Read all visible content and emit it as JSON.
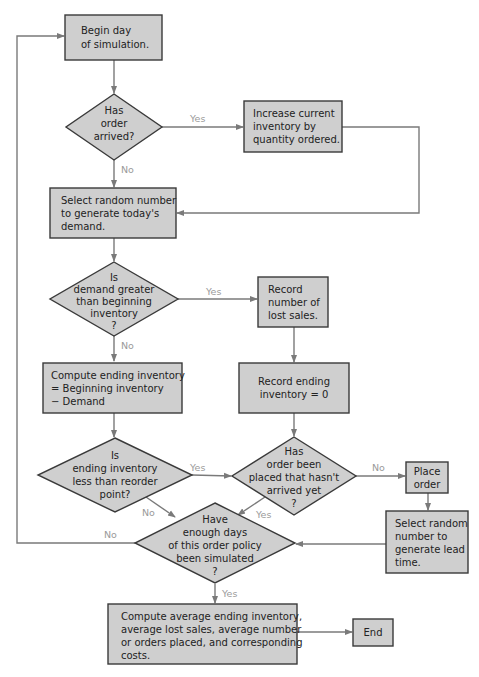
{
  "nodes": {
    "begin": {
      "type": "process",
      "lines": [
        "Begin day",
        "of simulation."
      ]
    },
    "order_arrived": {
      "type": "decision",
      "lines": [
        "Has",
        "order",
        "arrived?"
      ]
    },
    "increase_inventory": {
      "type": "process",
      "lines": [
        "Increase current",
        "inventory by",
        "quantity ordered."
      ]
    },
    "select_demand": {
      "type": "process",
      "lines": [
        "Select random number",
        "to generate today's",
        "demand."
      ]
    },
    "demand_greater": {
      "type": "decision",
      "lines": [
        "Is",
        "demand greater",
        "than beginning",
        "inventory",
        "?"
      ]
    },
    "record_lost_sales": {
      "type": "process",
      "lines": [
        "Record",
        "number of",
        "lost sales."
      ]
    },
    "compute_ending": {
      "type": "process",
      "lines": [
        "Compute ending inventory",
        "= Beginning inventory",
        "− Demand"
      ]
    },
    "record_ending_zero": {
      "type": "process",
      "lines": [
        "Record ending",
        "inventory = 0"
      ]
    },
    "ending_less_reorder": {
      "type": "decision",
      "lines": [
        "Is",
        "ending inventory",
        "less than reorder",
        "point?"
      ]
    },
    "order_placed": {
      "type": "decision",
      "lines": [
        "Has",
        "order been",
        "placed that hasn't",
        "arrived yet",
        "?"
      ]
    },
    "place_order": {
      "type": "process",
      "lines": [
        "Place",
        "order"
      ]
    },
    "select_lead": {
      "type": "process",
      "lines": [
        "Select random",
        "number to",
        "generate lead",
        "time."
      ]
    },
    "enough_days": {
      "type": "decision",
      "lines": [
        "Have",
        "enough days",
        "of this order policy",
        "been simulated",
        "?"
      ]
    },
    "compute_average": {
      "type": "process",
      "lines": [
        "Compute average ending inventory,",
        "average lost sales, average number",
        "or orders placed, and corresponding",
        "costs."
      ]
    },
    "end": {
      "type": "terminal",
      "lines": [
        "End"
      ]
    }
  },
  "edge_labels": {
    "order_arrived_yes": "Yes",
    "order_arrived_no": "No",
    "demand_greater_yes": "Yes",
    "demand_greater_no": "No",
    "ending_less_yes": "Yes",
    "ending_less_no": "No",
    "order_placed_no": "No",
    "order_placed_yes": "Yes",
    "enough_days_no": "No",
    "enough_days_yes": "Yes"
  },
  "colors": {
    "fill": "#cfcfcf",
    "stroke": "#3a3a3a",
    "connector": "#7a7a7a",
    "label": "#9a9a9a"
  }
}
